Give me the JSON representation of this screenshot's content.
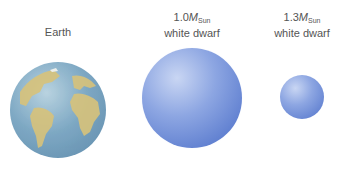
{
  "labels": {
    "earth": "Earth",
    "wd1_mass": "1.0",
    "wd1_symbol": "M",
    "wd1_sub": "Sun",
    "wd1_type": "white dwarf",
    "wd2_mass": "1.3",
    "wd2_symbol": "M",
    "wd2_sub": "Sun",
    "wd2_type": "white dwarf"
  },
  "colors": {
    "earth_ocean": "#7fa9c4",
    "earth_land": "#d8c27a",
    "white_dwarf": "#7b95da"
  }
}
